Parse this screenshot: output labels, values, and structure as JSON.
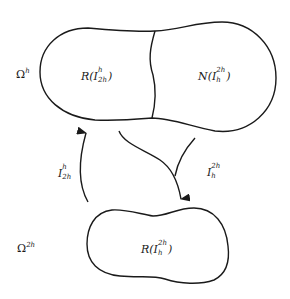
{
  "diagram": {
    "fine_space": {
      "label_base": "Ω",
      "label_sup": "h"
    },
    "coarse_space": {
      "label_base": "Ω",
      "label_sup": "2h"
    },
    "upper_region_left": {
      "prefix": "R(",
      "op": "I",
      "sup": "h",
      "sub": "2h",
      "suffix": ")"
    },
    "upper_region_right": {
      "prefix": "N(",
      "op": "I",
      "sup": "2h",
      "sub": "h",
      "suffix": ")"
    },
    "lower_region": {
      "prefix": "R(",
      "op": "I",
      "sup": "2h",
      "sub": "h",
      "suffix": ")"
    },
    "interpolation_arrow": {
      "op": "I",
      "sup": "h",
      "sub": "2h",
      "direction": "up"
    },
    "restriction_arrow": {
      "op": "I",
      "sup": "2h",
      "sub": "h",
      "direction": "down"
    },
    "stroke_color": "#1a1a1a"
  }
}
